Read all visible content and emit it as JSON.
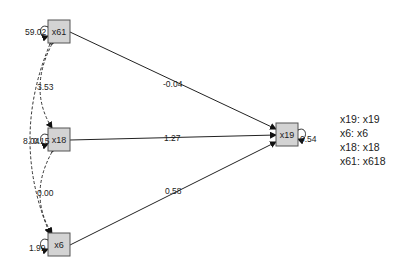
{
  "diagram": {
    "type": "path-diagram",
    "nodes": [
      {
        "id": "x61",
        "label": "x61",
        "variance": "59.02"
      },
      {
        "id": "x18",
        "label": "x18",
        "variance": "0.15"
      },
      {
        "id": "x6",
        "label": "x6",
        "variance": "1.99"
      },
      {
        "id": "x19",
        "label": "x19",
        "variance": "0.54"
      }
    ],
    "paths": [
      {
        "from": "x61",
        "to": "x19",
        "label": "-0.04"
      },
      {
        "from": "x18",
        "to": "x19",
        "label": "1.27"
      },
      {
        "from": "x6",
        "to": "x19",
        "label": "0.58"
      }
    ],
    "covariances": [
      {
        "between": [
          "x61",
          "x18"
        ],
        "label": "3.53"
      },
      {
        "between": [
          "x61",
          "x6"
        ],
        "label": "8.04"
      },
      {
        "between": [
          "x18",
          "x6"
        ],
        "label": "0.00"
      }
    ]
  },
  "legend": {
    "items": [
      "x19: x19",
      "x6: x6",
      "x18: x18",
      "x61: x618"
    ]
  },
  "colors": {
    "node_fill": "#d3d3d3",
    "node_stroke": "#555555",
    "edge": "#222222"
  }
}
